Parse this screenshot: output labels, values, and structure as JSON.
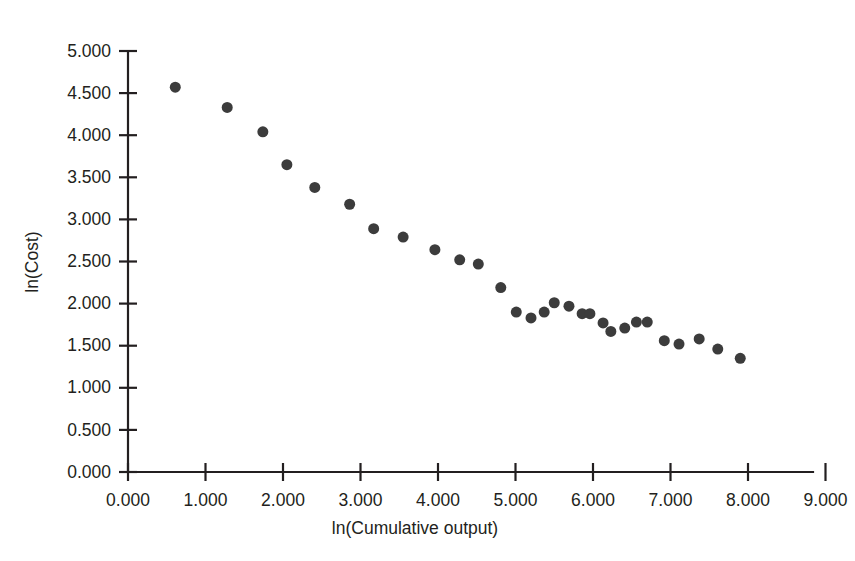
{
  "chart_data": {
    "type": "scatter",
    "title": "",
    "xlabel": "ln(Cumulative output)",
    "ylabel": "ln(Cost)",
    "xlim": [
      0.0,
      9.0
    ],
    "ylim": [
      0.0,
      5.0
    ],
    "xticks": [
      "0.000",
      "1.000",
      "2.000",
      "3.000",
      "4.000",
      "5.000",
      "6.000",
      "7.000",
      "8.000",
      "9.000"
    ],
    "xtick_values": [
      0,
      1,
      2,
      3,
      4,
      5,
      6,
      7,
      8,
      9
    ],
    "yticks": [
      "0.000",
      "0.500",
      "1.000",
      "1.500",
      "2.000",
      "2.500",
      "3.000",
      "3.500",
      "4.000",
      "4.500",
      "5.000"
    ],
    "ytick_values": [
      0,
      0.5,
      1,
      1.5,
      2,
      2.5,
      3,
      3.5,
      4,
      4.5,
      5
    ],
    "grid": false,
    "legend": false,
    "marker": {
      "shape": "circle",
      "color": "#3c3c3c",
      "size_px": 11
    },
    "series": [
      {
        "name": "observations",
        "points": [
          [
            0.61,
            4.57
          ],
          [
            1.28,
            4.33
          ],
          [
            1.74,
            4.04
          ],
          [
            2.05,
            3.65
          ],
          [
            2.41,
            3.38
          ],
          [
            2.86,
            3.18
          ],
          [
            3.17,
            2.89
          ],
          [
            3.55,
            2.79
          ],
          [
            3.96,
            2.64
          ],
          [
            4.28,
            2.52
          ],
          [
            4.52,
            2.47
          ],
          [
            4.81,
            2.19
          ],
          [
            5.01,
            1.9
          ],
          [
            5.2,
            1.83
          ],
          [
            5.37,
            1.9
          ],
          [
            5.5,
            2.01
          ],
          [
            5.69,
            1.97
          ],
          [
            5.86,
            1.88
          ],
          [
            5.96,
            1.88
          ],
          [
            6.13,
            1.77
          ],
          [
            6.23,
            1.67
          ],
          [
            6.41,
            1.71
          ],
          [
            6.56,
            1.78
          ],
          [
            6.7,
            1.78
          ],
          [
            6.92,
            1.56
          ],
          [
            7.11,
            1.52
          ],
          [
            7.37,
            1.58
          ],
          [
            7.61,
            1.46
          ],
          [
            7.9,
            1.35
          ]
        ]
      }
    ]
  },
  "axes_geometry": {
    "x_origin_px": 128,
    "y_origin_px": 472,
    "x_unit_px": 77.5,
    "y_unit_px": 84.2
  }
}
